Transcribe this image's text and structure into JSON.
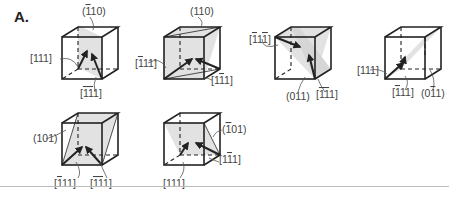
{
  "panel": {
    "label": "A."
  },
  "cubes": [
    {
      "plane": "(̄1̅ 10)",
      "plane_text": [
        "(",
        "1",
        "10)"
      ],
      "plane_bars": [
        true,
        false
      ],
      "dirs": [
        "[111]",
        "[1̄1̄1]"
      ]
    },
    {
      "plane": "(110)",
      "dirs": [
        "[1̄11]",
        "[11̄1]"
      ]
    },
    {
      "plane": "(011)",
      "dirs": [
        "[1̄ 11̄]",
        "[1̄1̄1]"
      ]
    },
    {
      "plane": "(01̄1)",
      "dirs": [
        "[111]",
        "[1̄11]"
      ]
    },
    {
      "plane": "(101)",
      "dirs": [
        "[1̄11]",
        "[1̄1̄1]"
      ]
    },
    {
      "plane": "(1̄01)",
      "dirs": [
        "[111]",
        "[11̄1]"
      ]
    }
  ],
  "labels": {
    "c1_plane": "(110)",
    "c1_plane_bar": "1",
    "c1_dir_a": "[111]",
    "c1_dir_b": "[111]",
    "c2_plane": "(110)",
    "c2_dir_a": "[111]",
    "c2_dir_b": "[111]",
    "c3_dir_a": "[111]",
    "c3_plane": "(011)",
    "c3_dir_b": "[111]",
    "c4_dir_a": "[111]",
    "c4_dir_b": "[111]",
    "c4_plane": "(011)",
    "c5_plane": "(101)",
    "c5_dir_a": "[111]",
    "c5_dir_b": "[111]",
    "c6_plane": "(101)",
    "c6_dir_a": "[111]",
    "c6_dir_b": "[111]"
  },
  "colors": {
    "plane_fill": "#e2e2e2",
    "edge": "#222222",
    "label": "#444444"
  }
}
